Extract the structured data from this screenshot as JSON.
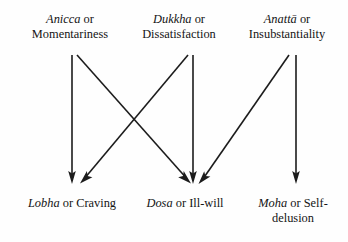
{
  "figure": {
    "background_color": "#fefefe",
    "ink_color": "#1c1c1c"
  },
  "top_labels": [
    {
      "id": "anicca",
      "term": "Anicca",
      "connector": " or",
      "gloss": "Momentariness",
      "x": 72
    },
    {
      "id": "dukkha",
      "term": "Dukkha",
      "connector": " or",
      "gloss": "Dissatisfaction",
      "x": 190
    },
    {
      "id": "anatta",
      "term": "Anattā",
      "connector": " or",
      "gloss": "Insubstantiality",
      "x": 293
    }
  ],
  "bottom_labels": [
    {
      "id": "lobha",
      "term": "Lobha",
      "connector": " or Craving",
      "gloss": "",
      "x": 74
    },
    {
      "id": "dosa",
      "term": "Dosa",
      "connector": " or Ill-will",
      "gloss": "",
      "x": 190
    },
    {
      "id": "moha",
      "term": "Moha",
      "connector": " or Self-",
      "gloss": "delusion",
      "x": 293
    }
  ],
  "arrows": [
    {
      "id": "anicca-to-lobha",
      "from": "anicca",
      "to": "lobha",
      "x1": 72,
      "y1": 55,
      "x2": 72,
      "y2": 183
    },
    {
      "id": "anicca-to-dosa",
      "from": "anicca",
      "to": "dosa",
      "x1": 77,
      "y1": 55,
      "x2": 190,
      "y2": 183
    },
    {
      "id": "dukkha-to-lobha",
      "from": "dukkha",
      "to": "lobha",
      "x1": 188,
      "y1": 55,
      "x2": 81,
      "y2": 183
    },
    {
      "id": "dukkha-to-dosa",
      "from": "dukkha",
      "to": "dosa",
      "x1": 193,
      "y1": 55,
      "x2": 193,
      "y2": 183
    },
    {
      "id": "anatta-to-dosa",
      "from": "anatta",
      "to": "dosa",
      "x1": 289,
      "y1": 55,
      "x2": 199,
      "y2": 183
    },
    {
      "id": "anatta-to-moha",
      "from": "anatta",
      "to": "moha",
      "x1": 296,
      "y1": 55,
      "x2": 296,
      "y2": 183
    }
  ]
}
